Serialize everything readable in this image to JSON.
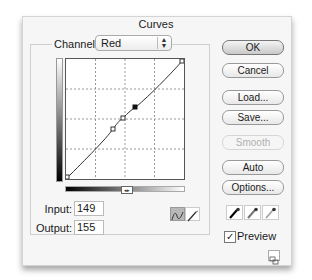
{
  "dialog": {
    "title": "Curves"
  },
  "channel": {
    "label": "Channel:",
    "selected": "Red"
  },
  "curve": {
    "points": [
      {
        "x": 0,
        "y": 0,
        "selected": false
      },
      {
        "x": 104,
        "y": 98,
        "selected": false
      },
      {
        "x": 124,
        "y": 127,
        "selected": false
      },
      {
        "x": 149,
        "y": 155,
        "selected": true
      },
      {
        "x": 255,
        "y": 255,
        "selected": false
      }
    ],
    "grid_divisions": 4
  },
  "io": {
    "input_label": "Input:",
    "input_value": "149",
    "output_label": "Output:",
    "output_value": "155"
  },
  "buttons": {
    "ok": "OK",
    "cancel": "Cancel",
    "load": "Load...",
    "save": "Save...",
    "smooth": "Smooth",
    "auto": "Auto",
    "options": "Options..."
  },
  "eyedroppers": [
    "black-point-eyedropper",
    "gray-point-eyedropper",
    "white-point-eyedropper"
  ],
  "preview": {
    "label": "Preview",
    "checked": true
  },
  "icons": {
    "curve_tool": "curve-tool-icon",
    "pencil_tool": "pencil-tool-icon",
    "resize": "expand-view-icon"
  }
}
